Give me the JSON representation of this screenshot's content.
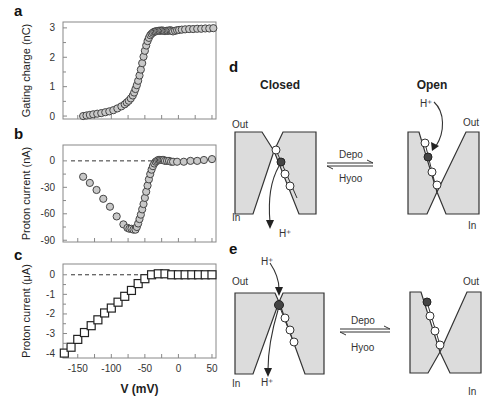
{
  "chart_data": [
    {
      "id": "a",
      "panel_label": "a",
      "type": "scatter",
      "marker": "circle",
      "ylabel": "Gating charge (nC)",
      "xlabel": "",
      "xlim": [
        -172,
        56
      ],
      "ylim": [
        -0.1,
        3.2
      ],
      "yticks": [
        0,
        1,
        2,
        3
      ],
      "xticks": [
        -150,
        -125,
        -100,
        -75,
        -50,
        -25,
        0,
        25,
        50
      ],
      "show_xtick_labels": false,
      "x": [
        -142,
        -137,
        -132,
        -127,
        -121,
        -115,
        -109,
        -103,
        -97,
        -91,
        -85,
        -80,
        -77,
        -74,
        -71,
        -68,
        -66,
        -64,
        -62,
        -60,
        -58,
        -56,
        -54,
        -52,
        -50,
        -48,
        -46,
        -44,
        -42,
        -40,
        -38,
        -36,
        -34,
        -32,
        -30,
        -28,
        -26,
        -24,
        -22,
        -20,
        -18,
        -16,
        -14,
        -12,
        -10,
        -8,
        -5,
        -2,
        1,
        5,
        10,
        16,
        22,
        28,
        34,
        40,
        46,
        52
      ],
      "y": [
        0.0,
        0.02,
        0.04,
        0.06,
        0.08,
        0.1,
        0.13,
        0.16,
        0.2,
        0.26,
        0.33,
        0.4,
        0.46,
        0.52,
        0.6,
        0.7,
        0.8,
        0.92,
        1.05,
        1.2,
        1.38,
        1.58,
        1.8,
        2.02,
        2.22,
        2.4,
        2.55,
        2.66,
        2.75,
        2.8,
        2.84,
        2.87,
        2.88,
        2.89,
        2.9,
        2.9,
        2.91,
        2.91,
        2.9,
        2.89,
        2.9,
        2.9,
        2.91,
        2.92,
        2.9,
        2.88,
        2.9,
        2.92,
        2.93,
        2.94,
        2.95,
        2.96,
        2.96,
        2.97,
        2.97,
        2.98,
        2.98,
        2.99
      ]
    },
    {
      "id": "b",
      "panel_label": "b",
      "type": "scatter",
      "marker": "circle",
      "ylabel": "Proton current (nA)",
      "xlabel": "",
      "xlim": [
        -172,
        56
      ],
      "ylim": [
        -92,
        18
      ],
      "yticks": [
        0,
        -30,
        -60,
        -90
      ],
      "xticks": [
        -150,
        -125,
        -100,
        -75,
        -50,
        -25,
        0,
        25,
        50
      ],
      "show_xtick_labels": false,
      "zero_line": true,
      "x": [
        -142,
        -132,
        -122,
        -112,
        -102,
        -92,
        -82,
        -76,
        -73,
        -70,
        -67,
        -64,
        -62,
        -60,
        -58,
        -56,
        -54,
        -52,
        -50,
        -48,
        -46,
        -44,
        -42,
        -40,
        -38,
        -36,
        -34,
        -32,
        -30,
        -28,
        -26,
        -24,
        -22,
        -20,
        -17,
        -14,
        -11,
        -8,
        -2,
        8,
        18,
        28,
        38,
        50
      ],
      "y": [
        -18,
        -25,
        -33,
        -43,
        -52,
        -63,
        -72,
        -76,
        -77,
        -77,
        -78,
        -78,
        -75,
        -71,
        -66,
        -61,
        -55,
        -49,
        -42,
        -35,
        -28,
        -21,
        -15,
        -10,
        -6,
        -3,
        -1,
        0,
        1,
        1,
        1,
        1,
        1,
        0,
        0,
        0,
        -1,
        -1,
        -1,
        -1,
        0,
        0,
        1,
        2
      ]
    },
    {
      "id": "c",
      "panel_label": "c",
      "type": "scatter",
      "marker": "square",
      "ylabel": "Proton current (μA)",
      "xlabel": "V (mV)",
      "xlim": [
        -172,
        56
      ],
      "ylim": [
        -4.25,
        0.55
      ],
      "yticks": [
        0,
        -1,
        -2,
        -3,
        -4
      ],
      "xticks": [
        -150,
        -125,
        -100,
        -75,
        -50,
        -25,
        0,
        25,
        50
      ],
      "xtick_labels": [
        "-150",
        "-100",
        "-50",
        "0",
        "50"
      ],
      "xtick_label_values": [
        -150,
        -100,
        -50,
        0,
        50
      ],
      "zero_line": true,
      "x": [
        -170,
        -160,
        -150,
        -140,
        -130,
        -120,
        -110,
        -100,
        -90,
        -80,
        -70,
        -60,
        -50,
        -40,
        -30,
        -20,
        -10,
        0,
        10,
        20,
        30,
        40,
        50
      ],
      "y": [
        -4.0,
        -3.7,
        -3.3,
        -2.95,
        -2.6,
        -2.3,
        -1.95,
        -1.7,
        -1.4,
        -1.1,
        -0.8,
        -0.45,
        -0.2,
        0.0,
        0.05,
        0.05,
        0.0,
        0.0,
        0.0,
        0.0,
        0.0,
        0.0,
        0.0
      ]
    }
  ],
  "diagrams": {
    "d": {
      "panel_label": "d",
      "closed_title": "Closed",
      "open_title": "Open",
      "out_label": "Out",
      "in_label": "In",
      "proton_label": "H⁺",
      "forward_label": "Depo",
      "reverse_label": "Hyoo"
    },
    "e": {
      "panel_label": "e",
      "out_label": "Out",
      "in_label": "In",
      "proton_in_label": "H⁺",
      "proton_out_label": "H⁺",
      "forward_label": "Depo",
      "reverse_label": "Hyoo"
    }
  }
}
